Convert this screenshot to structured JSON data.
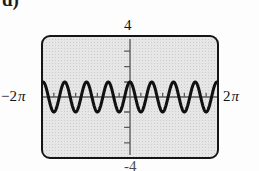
{
  "figure": {
    "part_label": "d)"
  },
  "labels": {
    "y_max": "4",
    "y_min": "-4",
    "x_min_number": "−2",
    "x_min_symbol": "π",
    "x_max_number": "2",
    "x_max_symbol": "π"
  },
  "colors": {
    "panel_fill": "#e6e6e6",
    "panel_border": "#151515",
    "curve": "#111111",
    "axis": "#5a5a5a",
    "text": "#111111"
  },
  "chart_data": {
    "type": "line",
    "title": "",
    "xlabel": "",
    "ylabel": "",
    "xlim": [
      -6.283185307,
      6.283185307
    ],
    "ylim": [
      -4,
      4
    ],
    "xtick_labels": [
      "−2π",
      "2π"
    ],
    "ytick_labels": [
      "4",
      "-4"
    ],
    "x_tick_step": 1.570796327,
    "y_tick_step": 1,
    "grid": false,
    "legend": null,
    "function": "y = cos(4x)",
    "amplitude": 1,
    "period": 1.570796327,
    "cycles_shown": 4,
    "phase": "cosine (maximum at x = 0)",
    "series": [
      {
        "name": "y = cos(4x)",
        "x": [
          -6.2832,
          -6.0832,
          -5.8832,
          -5.6832,
          -5.4832,
          -5.2832,
          -5.0832,
          -4.8832,
          -4.6832,
          -4.4832,
          -4.2832,
          -4.0832,
          -3.8832,
          -3.6832,
          -3.4832,
          -3.2832,
          -3.0832,
          -2.8832,
          -2.6832,
          -2.4832,
          -2.2832,
          -2.0832,
          -1.8832,
          -1.6832,
          -1.4832,
          -1.2832,
          -1.0832,
          -0.8832,
          -0.6832,
          -0.4832,
          -0.2832,
          -0.0832,
          0.1168,
          0.3168,
          0.5168,
          0.7168,
          0.9168,
          1.1168,
          1.3168,
          1.5168,
          1.7168,
          1.9168,
          2.1168,
          2.3168,
          2.5168,
          2.7168,
          2.9168,
          3.1168,
          3.3168,
          3.5168,
          3.7168,
          3.9168,
          4.1168,
          4.3168,
          4.5168,
          4.7168,
          4.9168,
          5.1168,
          5.3168,
          5.5168,
          5.7168,
          5.9168,
          6.1168,
          6.2832
        ],
        "y": [
          1.0,
          0.7,
          0.14,
          -0.47,
          -0.9,
          -1.0,
          -0.74,
          -0.21,
          0.41,
          0.87,
          1.0,
          0.78,
          0.28,
          -0.35,
          -0.83,
          -1.0,
          -0.82,
          -0.34,
          0.29,
          0.78,
          1.0,
          0.86,
          0.4,
          -0.22,
          -0.74,
          -0.99,
          -0.9,
          -0.48,
          0.15,
          0.7,
          0.99,
          0.95,
          0.9,
          0.52,
          -0.1,
          -0.66,
          -0.98,
          -0.97,
          -0.58,
          0.03,
          0.62,
          0.97,
          0.98,
          0.64,
          0.04,
          -0.57,
          -0.96,
          -0.99,
          -0.69,
          -0.12,
          0.51,
          0.93,
          1.0,
          0.73,
          0.19,
          -0.44,
          -0.89,
          -1.0,
          -0.77,
          -0.26,
          0.37,
          0.85,
          1.0,
          1.0
        ]
      }
    ]
  }
}
